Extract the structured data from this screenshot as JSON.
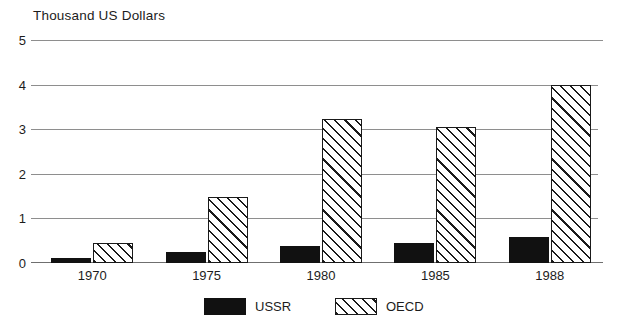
{
  "chart_data": {
    "type": "bar",
    "title": "Thousand US Dollars",
    "subtitle": "",
    "xlabel": "",
    "ylabel": "Thousand US Dollars",
    "categories": [
      "1970",
      "1975",
      "1980",
      "1985",
      "1988"
    ],
    "series": [
      {
        "name": "USSR",
        "values": [
          0.12,
          0.24,
          0.38,
          0.45,
          0.58
        ],
        "color": "#111111",
        "fill": "solid-black"
      },
      {
        "name": "OECD",
        "values": [
          0.45,
          1.48,
          3.22,
          3.05,
          4.0
        ],
        "color": "#1a1a1a",
        "fill": "diagonal-hatch"
      }
    ],
    "ylim": [
      0,
      5
    ],
    "yticks": [
      0,
      1,
      2,
      3,
      4,
      5
    ],
    "ytick_labels": [
      "0",
      "1",
      "2",
      "3",
      "4",
      "5"
    ],
    "grid": true,
    "grid_axis": "y",
    "legend_position": "bottom-center",
    "legend_entries": [
      "USSR",
      "OECD"
    ],
    "annotations": []
  },
  "legend": {
    "items": [
      {
        "label": "USSR",
        "swatch": "solid-black-swatch"
      },
      {
        "label": "OECD",
        "swatch": "hatched-swatch"
      }
    ]
  }
}
